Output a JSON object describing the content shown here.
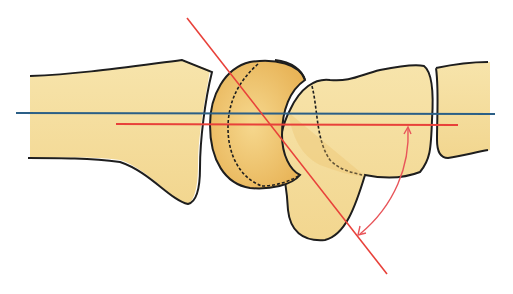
{
  "figure": {
    "colors": {
      "bone_fill": "#f3dc9c",
      "bone_fill_light": "#f8e9b8",
      "bone_shade": "#e9bd62",
      "outline": "#1e1e1e",
      "axis_blue": "#2b5f86",
      "axis_red": "#e8413a",
      "arc_red": "#e8555a",
      "background": "#ffffff"
    },
    "elements": {
      "radius": "radius-bone",
      "lunate": "lunate-bone",
      "capitate": "capitate-bone",
      "metacarpal": "metacarpal-bone",
      "blue_axis": "radius-longitudinal-axis",
      "red_axis": "capitate-axis",
      "diagonal_axis": "lunate-axis",
      "angle_arc": "angle-arc-with-arrows"
    },
    "caption": ""
  }
}
